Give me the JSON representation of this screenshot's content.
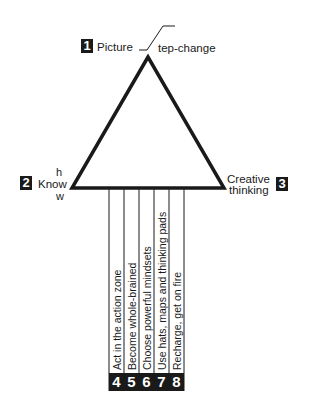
{
  "diagram": {
    "nodes": [
      {
        "number": "1",
        "label": "Picture",
        "step_change_suffix": "tep-change"
      },
      {
        "number": "2",
        "label": "Know",
        "superscript": "h",
        "subscript": "w"
      },
      {
        "number": "3",
        "label_line1": "Creative",
        "label_line2": "thinking"
      }
    ],
    "branches": [
      {
        "number": "4",
        "label": "Act in the action zone"
      },
      {
        "number": "5",
        "label": "Become whole-brained"
      },
      {
        "number": "6",
        "label": "Choose powerful mindsets"
      },
      {
        "number": "7",
        "label": "Use hats, maps and thinking pads"
      },
      {
        "number": "8",
        "label": "Recharge, get on fire"
      }
    ],
    "colors": {
      "ink": "#1a1a1a",
      "background": "#ffffff"
    }
  }
}
